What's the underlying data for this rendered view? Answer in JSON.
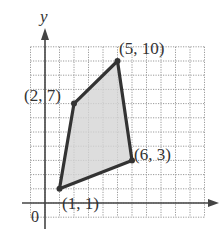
{
  "figure": {
    "axis_labels": {
      "x": "",
      "y": "y",
      "origin": "0"
    },
    "grid": {
      "x_min": -1,
      "x_max": 11,
      "y_min": -1,
      "y_max": 11,
      "step": 1
    },
    "polygon": {
      "vertices": [
        {
          "x": 1,
          "y": 1,
          "label": "(1, 1)"
        },
        {
          "x": 2,
          "y": 7,
          "label": "(2, 7)"
        },
        {
          "x": 5,
          "y": 10,
          "label": "(5, 10)"
        },
        {
          "x": 6,
          "y": 3,
          "label": "(6, 3)"
        }
      ],
      "fill_color": "#d4d4d4",
      "stroke_color": "#333333"
    },
    "colors": {
      "grid": "#9a9a9a",
      "axis": "#444444",
      "background": "#ffffff"
    }
  },
  "chart_data": {
    "type": "scatter",
    "title": "",
    "xlabel": "",
    "ylabel": "y",
    "xlim": [
      -1,
      11
    ],
    "ylim": [
      -1,
      11
    ],
    "grid": true,
    "series": [
      {
        "name": "quadrilateral vertices",
        "points": [
          [
            1,
            1
          ],
          [
            2,
            7
          ],
          [
            5,
            10
          ],
          [
            6,
            3
          ]
        ],
        "labels": [
          "(1, 1)",
          "(2, 7)",
          "(5, 10)",
          "(6, 3)"
        ],
        "closed_polygon": true,
        "filled": true
      }
    ],
    "annotations": [
      "(1, 1)",
      "(2, 7)",
      "(5, 10)",
      "(6, 3)",
      "0",
      "y"
    ]
  }
}
